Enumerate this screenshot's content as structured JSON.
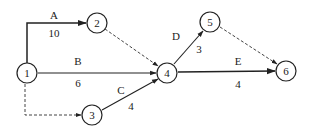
{
  "diagram": {
    "type": "activity-on-arrow network",
    "nodes": [
      {
        "id": "1",
        "label": "1",
        "x": 27,
        "y": 73
      },
      {
        "id": "2",
        "label": "2",
        "x": 97,
        "y": 23
      },
      {
        "id": "3",
        "label": "3",
        "x": 92,
        "y": 115
      },
      {
        "id": "4",
        "label": "4",
        "x": 167,
        "y": 73
      },
      {
        "id": "5",
        "label": "5",
        "x": 210,
        "y": 22
      },
      {
        "id": "6",
        "label": "6",
        "x": 286,
        "y": 71
      }
    ],
    "activities": [
      {
        "name": "A",
        "duration": "10",
        "from": "1",
        "to": "2",
        "style": "solid"
      },
      {
        "name": "B",
        "duration": "6",
        "from": "1",
        "to": "4",
        "style": "solid"
      },
      {
        "name": "C",
        "duration": "4",
        "from": "3",
        "to": "4",
        "style": "solid"
      },
      {
        "name": "D",
        "duration": "3",
        "from": "4",
        "to": "5",
        "style": "solid"
      },
      {
        "name": "E",
        "duration": "4",
        "from": "4",
        "to": "6",
        "style": "solid"
      }
    ],
    "dummies": [
      {
        "from": "2",
        "to": "4",
        "style": "dashed"
      },
      {
        "from": "1",
        "to": "3",
        "style": "dashed"
      },
      {
        "from": "5",
        "to": "6",
        "style": "dashed"
      }
    ]
  }
}
